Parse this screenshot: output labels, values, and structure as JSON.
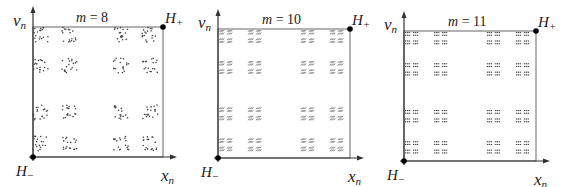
{
  "figure": {
    "panels": [
      {
        "id": "m8",
        "title_var": "m",
        "title_eq": " = ",
        "m": "8",
        "offset_x": 0,
        "axes": {
          "origin": [
            33,
            157
          ],
          "top_right": [
            163,
            27
          ],
          "x_arrow_end": 177,
          "y_arrow_end": 6
        },
        "y_label": {
          "main": "v",
          "sub": "n"
        },
        "x_label": {
          "main": "x",
          "sub": "n"
        },
        "corner_top_right": {
          "main": "H",
          "sub": "+"
        },
        "corner_bottom_left": {
          "main": "H",
          "sub": "−"
        },
        "point_style": "dots"
      },
      {
        "id": "m10",
        "title_var": "m",
        "title_eq": " = ",
        "m": "10",
        "offset_x": 0,
        "axes": {
          "origin": [
            218,
            158
          ],
          "top_right": [
            350,
            29
          ],
          "x_arrow_end": 364,
          "y_arrow_end": 9
        },
        "y_label": {
          "main": "v",
          "sub": "n"
        },
        "x_label": {
          "main": "x",
          "sub": "n"
        },
        "corner_top_right": {
          "main": "H",
          "sub": "+"
        },
        "corner_bottom_left": {
          "main": "H",
          "sub": "−"
        },
        "point_style": "pairs"
      },
      {
        "id": "m11",
        "title_var": "m",
        "title_eq": " = ",
        "m": "11",
        "offset_x": 0,
        "axes": {
          "origin": [
            404,
            161
          ],
          "top_right": [
            536,
            31
          ],
          "x_arrow_end": 550,
          "y_arrow_end": 11
        },
        "y_label": {
          "main": "v",
          "sub": "n"
        },
        "x_label": {
          "main": "x",
          "sub": "n"
        },
        "corner_top_right": {
          "main": "H",
          "sub": "+"
        },
        "corner_bottom_left": {
          "main": "H",
          "sub": "−"
        },
        "point_style": "blocks"
      }
    ],
    "colors": {
      "axis": "#333333",
      "box": "#666666",
      "points": "#444444",
      "marker": "#000000"
    }
  }
}
